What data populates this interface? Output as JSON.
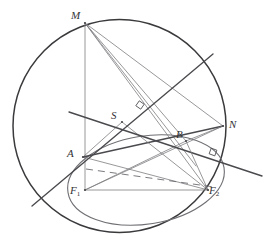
{
  "figure": {
    "background_color": "#ffffff",
    "width": 274,
    "height": 249,
    "stroke_colors": {
      "circle": "#3a3a3d",
      "ellipse": "#6f6f74",
      "heavy_line": "#4a4a4e",
      "light_line": "#7d7d82",
      "dashed_line": "#6b6b70",
      "label_text": "#333336"
    }
  },
  "points": [
    {
      "id": "M",
      "label": "M",
      "x": 85,
      "y": 23,
      "label_x": 71,
      "label_y": 10
    },
    {
      "id": "S",
      "label": "S",
      "x": 122,
      "y": 122,
      "label_x": 111,
      "label_y": 110
    },
    {
      "id": "N",
      "label": "N",
      "x": 223,
      "y": 126,
      "label_x": 229,
      "label_y": 119
    },
    {
      "id": "B",
      "label": "B",
      "x": 186,
      "y": 141,
      "label_x": 176,
      "label_y": 129
    },
    {
      "id": "A",
      "label": "A",
      "x": 83,
      "y": 157,
      "label_x": 67,
      "label_y": 148
    },
    {
      "id": "F1",
      "label": "F",
      "sub": "1",
      "x": 85,
      "y": 190,
      "label_x": 70,
      "label_y": 185
    },
    {
      "id": "F2",
      "label": "F",
      "sub": "2",
      "x": 208,
      "y": 190,
      "label_x": 209,
      "label_y": 185
    }
  ],
  "circle": {
    "name": "circumcircle",
    "cx": 119.5,
    "cy": 126,
    "r": 106.5,
    "stroke_width": 1.5
  },
  "ellipse": {
    "name": "inscribed-ellipse",
    "cx": 146,
    "cy": 180,
    "rx": 79,
    "ry": 44,
    "rotation_deg": -9,
    "stroke_width": 1.1
  },
  "segments": [
    {
      "name": "chord-m-to-f1-vertical",
      "x1": 85,
      "y1": 23,
      "x2": 85,
      "y2": 190,
      "weight": "light"
    },
    {
      "name": "chord-m-to-n",
      "x1": 85,
      "y1": 23,
      "x2": 223,
      "y2": 126,
      "weight": "light"
    },
    {
      "name": "chord-m-to-b",
      "x1": 85,
      "y1": 23,
      "x2": 186,
      "y2": 141,
      "weight": "light"
    },
    {
      "name": "chord-m-to-f2",
      "x1": 85,
      "y1": 23,
      "x2": 208,
      "y2": 190,
      "weight": "light"
    },
    {
      "name": "chord-m-to-a-lower",
      "x1": 85,
      "y1": 23,
      "x2": 196,
      "y2": 166,
      "weight": "light"
    },
    {
      "name": "segment-f1-to-n",
      "x1": 85,
      "y1": 190,
      "x2": 223,
      "y2": 126,
      "weight": "light"
    },
    {
      "name": "segment-f1-to-b",
      "x1": 85,
      "y1": 190,
      "x2": 186,
      "y2": 141,
      "weight": "light"
    },
    {
      "name": "segment-a-to-f2",
      "x1": 83,
      "y1": 157,
      "x2": 208,
      "y2": 190,
      "weight": "light"
    },
    {
      "name": "segment-a-to-n",
      "x1": 83,
      "y1": 157,
      "x2": 223,
      "y2": 126,
      "weight": "heavy"
    },
    {
      "name": "segment-f1-to-f2",
      "x1": 85,
      "y1": 190,
      "x2": 208,
      "y2": 190,
      "weight": "light"
    },
    {
      "name": "segment-s-to-f2",
      "x1": 122,
      "y1": 122,
      "x2": 208,
      "y2": 190,
      "weight": "light"
    },
    {
      "name": "segment-s-to-a",
      "x1": 122,
      "y1": 122,
      "x2": 83,
      "y2": 157,
      "weight": "light"
    },
    {
      "name": "tangent-line-through-a",
      "x1": 32,
      "y1": 206,
      "x2": 213,
      "y2": 54,
      "weight": "heavy"
    },
    {
      "name": "secant-line-through-s",
      "x1": 69,
      "y1": 112,
      "x2": 262,
      "y2": 176,
      "weight": "heavy"
    },
    {
      "name": "segment-b-to-f2",
      "x1": 186,
      "y1": 141,
      "x2": 208,
      "y2": 190,
      "weight": "light"
    },
    {
      "name": "segment-b-to-n",
      "x1": 186,
      "y1": 141,
      "x2": 223,
      "y2": 126,
      "weight": "light"
    }
  ],
  "dashed_segments": [
    {
      "name": "dashed-a-to-f2",
      "x1": 86,
      "y1": 169,
      "x2": 214,
      "y2": 187
    }
  ],
  "right_angle_marks": [
    {
      "name": "right-angle-mark-upper",
      "cx": 140,
      "cy": 105,
      "size": 6,
      "rotation_deg": 35
    },
    {
      "name": "right-angle-mark-lower",
      "cx": 213,
      "cy": 152,
      "size": 6,
      "rotation_deg": 20
    }
  ]
}
